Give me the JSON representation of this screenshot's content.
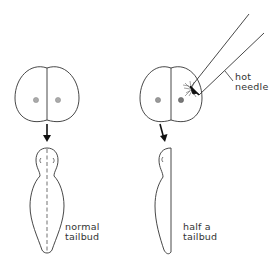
{
  "diagram": {
    "left_panel": {
      "stage_1": "two-cell embryo",
      "stage_2": "embryo",
      "label_line1": "normal",
      "label_line2": "tailbud"
    },
    "right_panel": {
      "stage_1": "two-cell embryo with one cell destroyed",
      "tool_label_line1": "hot",
      "tool_label_line2": "needle",
      "label_line1": "half a",
      "label_line2": "tailbud"
    },
    "colors": {
      "line": "#333333",
      "nucleus": "#9a9a9a",
      "nucleus_damaged": "#6e6e6e"
    }
  }
}
